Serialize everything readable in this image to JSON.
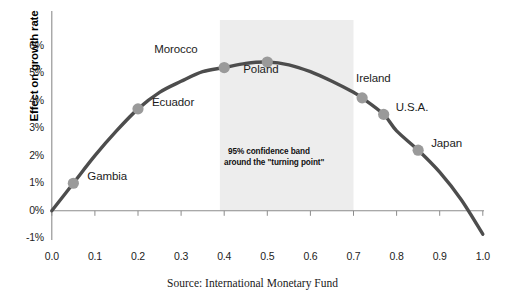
{
  "chart_data": {
    "type": "scatter",
    "title": "",
    "subtitle": "",
    "xlabel": "",
    "ylabel": "Effect on growth rate",
    "source": "Source: International Monetary Fund",
    "xlim": [
      0.0,
      1.0
    ],
    "ylim": [
      -0.01,
      0.06
    ],
    "x_ticks": [
      "0.0",
      "0.1",
      "0.2",
      "0.3",
      "0.4",
      "0.5",
      "0.6",
      "0.7",
      "0.8",
      "0.9",
      "1.0"
    ],
    "x_tick_values": [
      0.0,
      0.1,
      0.2,
      0.3,
      0.4,
      0.5,
      0.6,
      0.7,
      0.8,
      0.9,
      1.0
    ],
    "y_ticks": [
      "6%",
      "5%",
      "4%",
      "3%",
      "2%",
      "1%",
      "0%",
      "-1%"
    ],
    "y_tick_values": [
      6,
      5,
      4,
      3,
      2,
      1,
      0,
      -1
    ],
    "grid": false,
    "legend": "none",
    "curve": {
      "name": "fitted-inverted-u-curve",
      "description": "Inverted U-shaped quadratic relationship between financial depth and growth",
      "color": "#4d4d4d",
      "points": [
        {
          "x": 0.0,
          "y": 0.0
        },
        {
          "x": 0.05,
          "y": 1.0
        },
        {
          "x": 0.1,
          "y": 2.0
        },
        {
          "x": 0.15,
          "y": 2.9
        },
        {
          "x": 0.2,
          "y": 3.7
        },
        {
          "x": 0.25,
          "y": 4.3
        },
        {
          "x": 0.3,
          "y": 4.7
        },
        {
          "x": 0.35,
          "y": 5.05
        },
        {
          "x": 0.4,
          "y": 5.2
        },
        {
          "x": 0.45,
          "y": 5.35
        },
        {
          "x": 0.5,
          "y": 5.4
        },
        {
          "x": 0.55,
          "y": 5.3
        },
        {
          "x": 0.6,
          "y": 5.05
        },
        {
          "x": 0.65,
          "y": 4.7
        },
        {
          "x": 0.7,
          "y": 4.3
        },
        {
          "x": 0.72,
          "y": 4.1
        },
        {
          "x": 0.77,
          "y": 3.5
        },
        {
          "x": 0.8,
          "y": 2.9
        },
        {
          "x": 0.85,
          "y": 2.2
        },
        {
          "x": 0.9,
          "y": 1.4
        },
        {
          "x": 0.95,
          "y": 0.4
        },
        {
          "x": 1.0,
          "y": -0.85
        }
      ]
    },
    "markers": [
      {
        "label": "Gambia",
        "x": 0.05,
        "y": 1.0,
        "label_dx": 14,
        "label_dy": -6
      },
      {
        "label": "Ecuador",
        "x": 0.2,
        "y": 3.7,
        "label_dx": 14,
        "label_dy": -6
      },
      {
        "label": "Morocco",
        "x": 0.4,
        "y": 5.2,
        "label_dx": -70,
        "label_dy": -18
      },
      {
        "label": "Poland",
        "x": 0.5,
        "y": 5.4,
        "label_dx": -24,
        "label_dy": 8
      },
      {
        "label": "Ireland",
        "x": 0.72,
        "y": 4.1,
        "label_dx": -6,
        "label_dy": -19
      },
      {
        "label": "U.S.A.",
        "x": 0.77,
        "y": 3.5,
        "label_dx": 12,
        "label_dy": -6
      },
      {
        "label": "Japan",
        "x": 0.85,
        "y": 2.2,
        "label_dx": 13,
        "label_dy": -6
      }
    ],
    "confidence_band": {
      "x_start": 0.39,
      "x_end": 0.7,
      "color": "#ededed",
      "note_line1": "95%  confidence band",
      "note_line2": "around the \"turning point\""
    },
    "colors": {
      "curve": "#4d4d4d",
      "marker": "#9a9a9a",
      "axis": "#8c8c8c",
      "band": "#ededed",
      "text": "#1c1c1c"
    }
  }
}
